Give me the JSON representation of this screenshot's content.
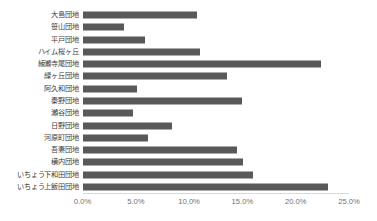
{
  "chart_data": {
    "type": "bar",
    "orientation": "horizontal",
    "title": "",
    "subtitle": "",
    "xlabel": "",
    "ylabel": "",
    "xlim": [
      0,
      25
    ],
    "xticks": [
      0,
      5,
      10,
      15,
      20,
      25
    ],
    "xtick_labels": [
      "0.0%",
      "5.0%",
      "10.0%",
      "15.0%",
      "20.0%",
      "25.0%"
    ],
    "grid": false,
    "legend": null,
    "bar_color": "#595959",
    "axis_color": "#d9d9d9",
    "background": "#ffffff",
    "unit": "%",
    "categories": [
      "大島団地",
      "笹山団地",
      "平戸団地",
      "ハイム桜ヶ丘",
      "綾瀬寺尾団地",
      "緑ヶ丘団地",
      "阿久和団地",
      "秦野団地",
      "瀬谷団地",
      "日野団地",
      "河原町団地",
      "吾妻団地",
      "横内団地",
      "いちょう下和田団地",
      "いちょう上飯田団地"
    ],
    "values": [
      10.7,
      3.9,
      5.9,
      11.0,
      22.4,
      13.6,
      5.1,
      15.0,
      4.7,
      8.4,
      6.1,
      14.5,
      15.1,
      16.0,
      23.0
    ],
    "points": [
      {
        "category": "大島団地",
        "value": 10.7
      },
      {
        "category": "笹山団地",
        "value": 3.9
      },
      {
        "category": "平戸団地",
        "value": 5.9
      },
      {
        "category": "ハイム桜ヶ丘",
        "value": 11.0
      },
      {
        "category": "綾瀬寺尾団地",
        "value": 22.4
      },
      {
        "category": "緑ヶ丘団地",
        "value": 13.6
      },
      {
        "category": "阿久和団地",
        "value": 5.1
      },
      {
        "category": "秦野団地",
        "value": 15.0
      },
      {
        "category": "瀬谷団地",
        "value": 4.7
      },
      {
        "category": "日野団地",
        "value": 8.4
      },
      {
        "category": "河原町団地",
        "value": 6.1
      },
      {
        "category": "吾妻団地",
        "value": 14.5
      },
      {
        "category": "横内団地",
        "value": 15.1
      },
      {
        "category": "いちょう下和田団地",
        "value": 16.0
      },
      {
        "category": "いちょう上飯田団地",
        "value": 23.0
      }
    ]
  }
}
